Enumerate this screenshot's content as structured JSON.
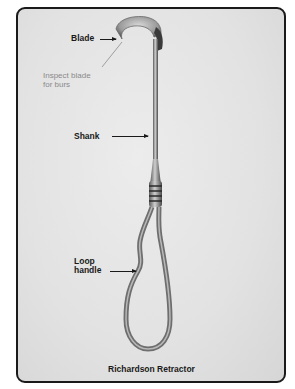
{
  "figure": {
    "caption": "Richardson Retractor",
    "labels": {
      "blade": "Blade",
      "shank": "Shank",
      "loop_handle_line1": "Loop",
      "loop_handle_line2": "handle"
    },
    "annotation": {
      "line1": "Inspect blade",
      "line2": "for burs"
    },
    "colors": {
      "frame_border": "#1a1a1a",
      "background": "#e4e4e4",
      "label_text": "#1a1a1a",
      "annotation_text": "#8a8a8a"
    }
  }
}
